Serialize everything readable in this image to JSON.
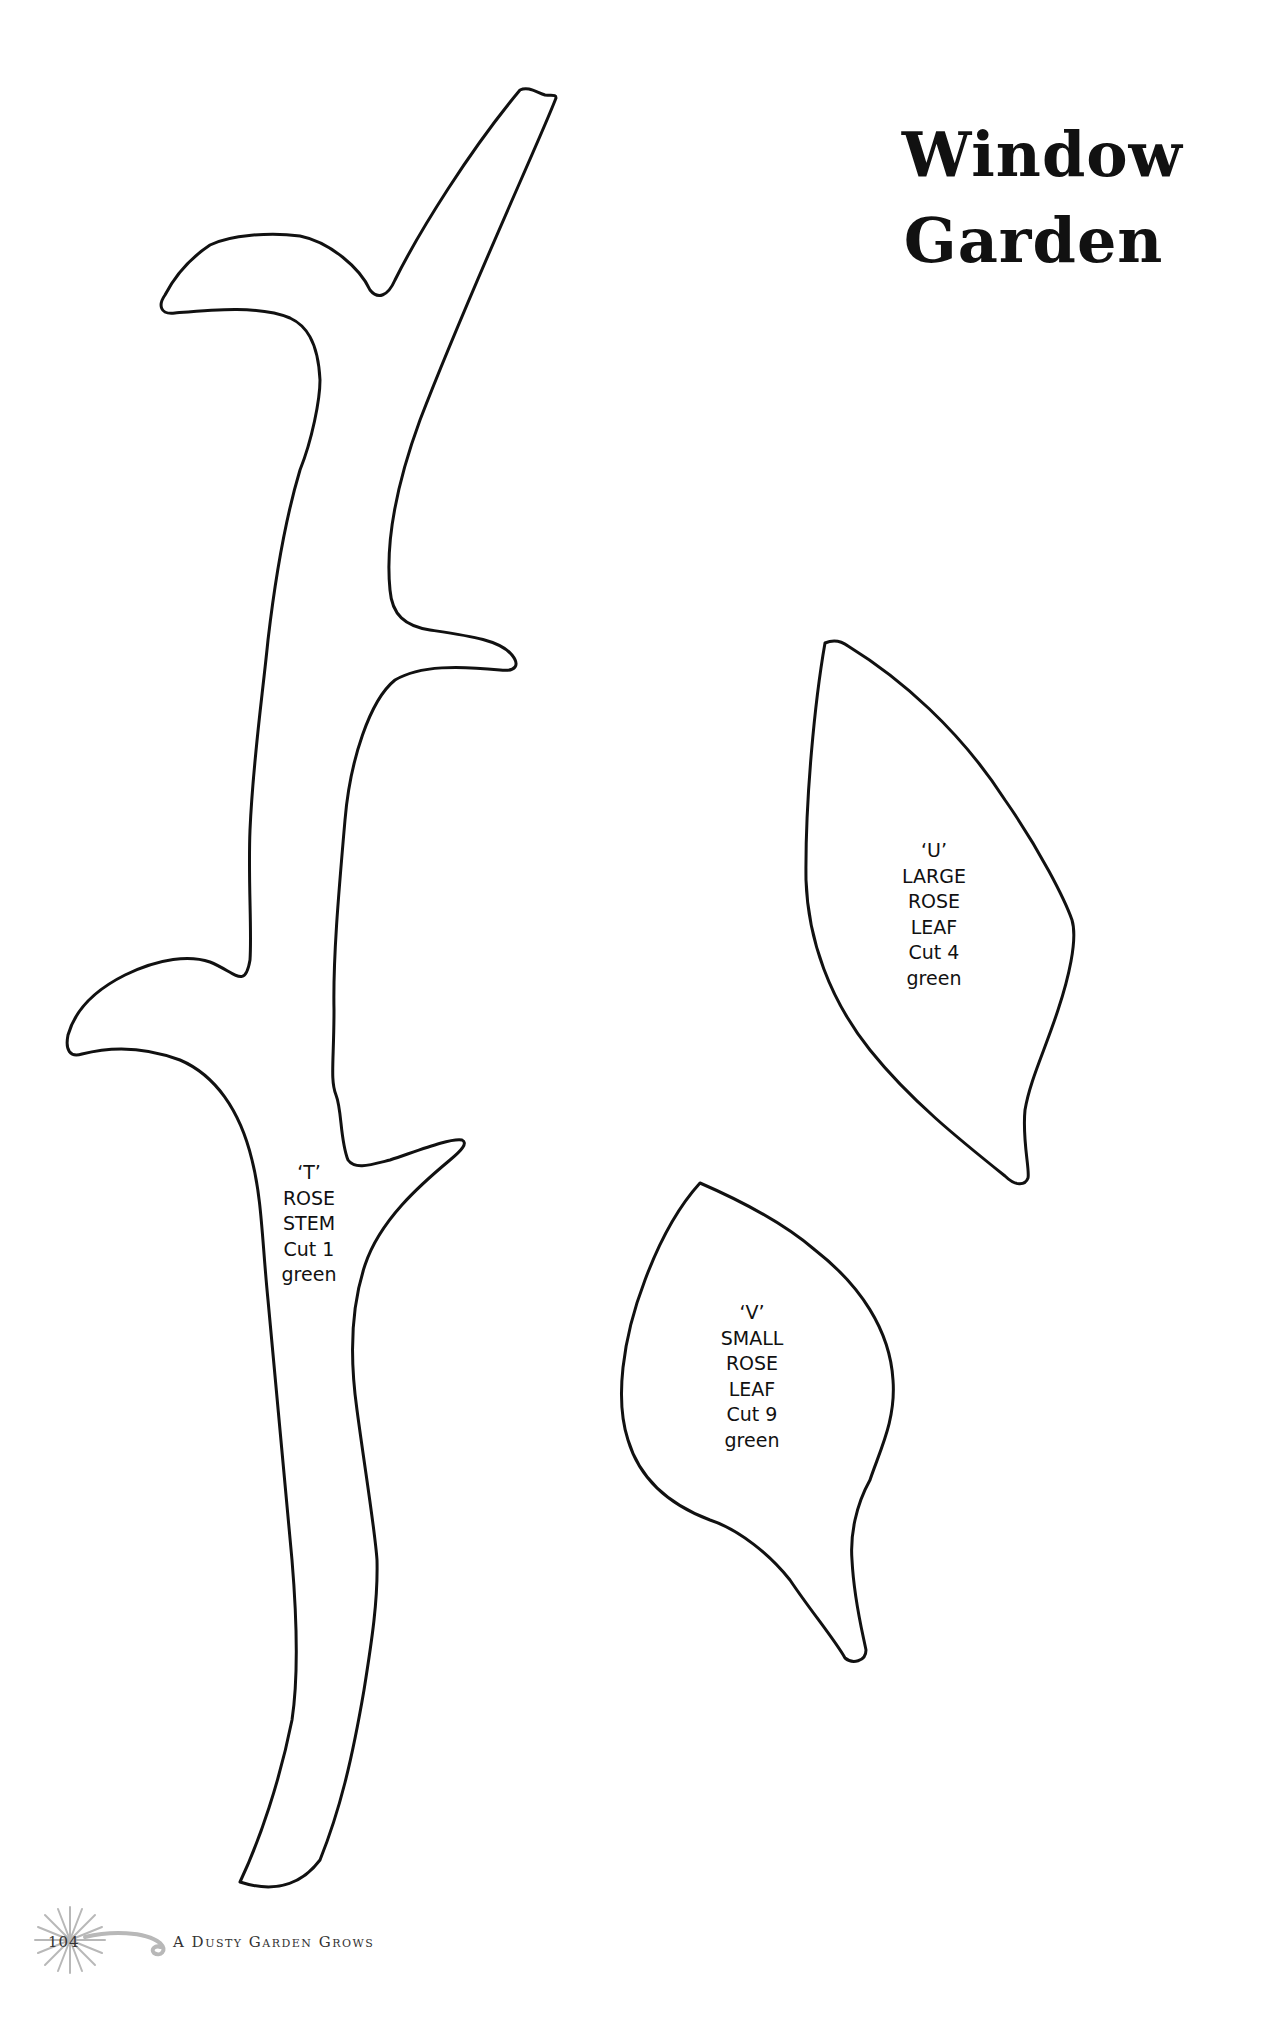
{
  "page": {
    "title_line1": "Window",
    "title_line2": "Garden",
    "background": "#ffffff",
    "outline_color": "#111111"
  },
  "patterns": [
    {
      "id": "T",
      "letter": "‘T’",
      "lines": [
        "ROSE",
        "STEM"
      ],
      "cut": "Cut 1",
      "color": "green"
    },
    {
      "id": "U",
      "letter": "‘U’",
      "lines": [
        "LARGE",
        "ROSE",
        "LEAF"
      ],
      "cut": "Cut 4",
      "color": "green"
    },
    {
      "id": "V",
      "letter": "‘V’",
      "lines": [
        "SMALL",
        "ROSE",
        "LEAF"
      ],
      "cut": "Cut 9",
      "color": "green"
    }
  ],
  "footer": {
    "page_number": "104",
    "book_title": "A Dusty Garden Grows",
    "ornament": "dandelion-swirl-icon"
  }
}
